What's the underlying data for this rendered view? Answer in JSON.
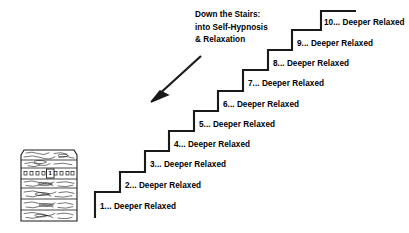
{
  "figure": {
    "heading": {
      "line1": "Down the Stairs:",
      "line2": "into Self-Hypnosis",
      "line3": "& Relaxation"
    },
    "arrow": {
      "name": "down-left-arrow",
      "direction": "down-left"
    },
    "house": {
      "name": "brick-house-illustration",
      "door_number": "1"
    },
    "steps": [
      {
        "number": "1",
        "label": "1... Deeper Relaxed",
        "x": 100,
        "y": 202
      },
      {
        "number": "2",
        "label": "2... Deeper Relaxed",
        "x": 125,
        "y": 181
      },
      {
        "number": "3",
        "label": "3... Deeper Relaxed",
        "x": 150,
        "y": 160
      },
      {
        "number": "4",
        "label": "4... Deeper Relaxed",
        "x": 174,
        "y": 140
      },
      {
        "number": "5",
        "label": "5... Deeper Relaxed",
        "x": 199,
        "y": 120
      },
      {
        "number": "6",
        "label": "6... Deeper Relaxed",
        "x": 223,
        "y": 100
      },
      {
        "number": "7",
        "label": "7... Deeper Relaxed",
        "x": 248,
        "y": 79
      },
      {
        "number": "8",
        "label": "8... Deeper Relaxed",
        "x": 273,
        "y": 59
      },
      {
        "number": "9",
        "label": "9... Deeper Relaxed",
        "x": 297,
        "y": 39
      },
      {
        "number": "10",
        "label": "10... Deeper Relaxed",
        "x": 324,
        "y": 18
      }
    ],
    "colors": {
      "ink": "#1a1a1a",
      "background": "#ffffff"
    }
  }
}
